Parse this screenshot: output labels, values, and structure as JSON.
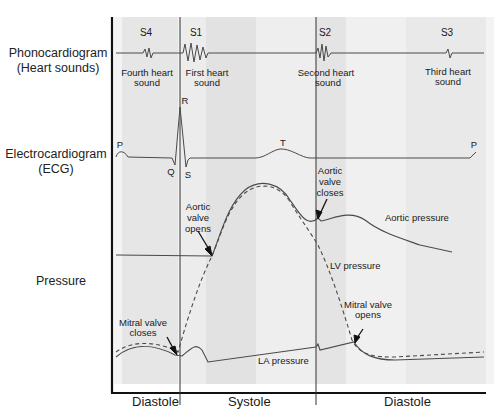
{
  "row_labels": {
    "phonocardiogram": [
      "Phonocardiogram",
      "(Heart sounds)"
    ],
    "ecg": [
      "Electrocardiogram",
      "(ECG)"
    ],
    "pressure": "Pressure"
  },
  "heart_sounds": [
    {
      "id": "S4",
      "caption": [
        "Fourth heart",
        "sound"
      ]
    },
    {
      "id": "S1",
      "caption": [
        "First heart",
        "sound"
      ]
    },
    {
      "id": "S2",
      "caption": [
        "Second heart",
        "sound"
      ]
    },
    {
      "id": "S3",
      "caption": [
        "Third heart",
        "sound"
      ]
    }
  ],
  "ecg_waves": {
    "p_start": "P",
    "q": "Q",
    "r": "R",
    "s": "S",
    "t": "T",
    "p_end": "P"
  },
  "annotations": {
    "aortic_valve_opens": [
      "Aortic",
      "valve",
      "opens"
    ],
    "aortic_valve_closes": [
      "Aortic",
      "valve",
      "closes"
    ],
    "aortic_pressure": "Aortic pressure",
    "lv_pressure": "LV pressure",
    "mitral_valve_closes": [
      "Mitral valve",
      "closes"
    ],
    "mitral_valve_opens": [
      "Mitral valve",
      "opens"
    ],
    "la_pressure": "LA pressure"
  },
  "phases": [
    "Diastole",
    "Systole",
    "Diastole"
  ],
  "colors": {
    "trace": "#4a4a4a",
    "band_light": "#f0f0f0",
    "band_dark": "#e4e4e4",
    "axis": "#111111"
  }
}
